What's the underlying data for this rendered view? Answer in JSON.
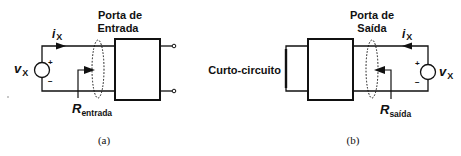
{
  "figure_a": {
    "port_label_line1": "Porta de",
    "port_label_line2": "Entrada",
    "current_symbol": "i",
    "current_subscript": "X",
    "voltage_symbol": "v",
    "voltage_subscript": "X",
    "plus_sign": "+",
    "minus_sign": "−",
    "resistance_symbol": "R",
    "resistance_subscript": "entrada",
    "caption": "(a)"
  },
  "figure_b": {
    "port_label_line1": "Porta de",
    "port_label_line2": "Saída",
    "current_symbol": "i",
    "current_subscript": "X",
    "voltage_symbol": "v",
    "voltage_subscript": "X",
    "plus_sign": "+",
    "minus_sign": "−",
    "resistance_symbol": "R",
    "resistance_subscript": "saída",
    "short_circuit_label": "Curto-circuito",
    "caption": "(b)"
  },
  "colors": {
    "line": "#111111",
    "background": "#ffffff"
  }
}
